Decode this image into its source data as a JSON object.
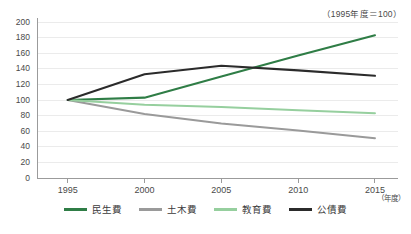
{
  "chart_data": {
    "type": "line",
    "title": "",
    "annotation": "（1995年度＝100）",
    "xlabel": "（年度）",
    "ylabel": "",
    "categories": [
      1995,
      2000,
      2005,
      2010,
      2015
    ],
    "tick_labels_x": [
      "1995",
      "2000",
      "2005",
      "2010",
      "2015"
    ],
    "tick_labels_y": [
      "0",
      "20",
      "40",
      "60",
      "80",
      "100",
      "120",
      "140",
      "160",
      "180",
      "200"
    ],
    "xlim": [
      1993,
      2016.5
    ],
    "ylim": [
      0,
      200
    ],
    "ystep": 20,
    "grid": "horizontal",
    "legend_position": "bottom",
    "series": [
      {
        "name": "民生費",
        "color": "#2f7d46",
        "values": [
          100,
          103,
          130,
          157,
          183
        ]
      },
      {
        "name": "土木費",
        "color": "#9a9a9a",
        "values": [
          100,
          82,
          70,
          61,
          51
        ]
      },
      {
        "name": "教育費",
        "color": "#96cf9e",
        "values": [
          100,
          94,
          91,
          87,
          83
        ]
      },
      {
        "name": "公債費",
        "color": "#2b2b2b",
        "values": [
          100,
          133,
          144,
          138,
          131
        ]
      }
    ]
  },
  "colors": {
    "axis": "#9b9b9b",
    "grid": "#ebebeb",
    "text": "#4a4a4a",
    "background": "#ffffff"
  }
}
